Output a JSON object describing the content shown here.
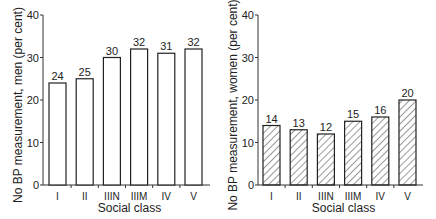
{
  "chart_data": [
    {
      "type": "bar",
      "title": "",
      "xlabel": "Social class",
      "ylabel": "No BP measurement, men (per cent)",
      "categories": [
        "I",
        "II",
        "IIIN",
        "IIIM",
        "IV",
        "V"
      ],
      "values": [
        24,
        25,
        30,
        32,
        31,
        32
      ],
      "data_labels": [
        "24",
        "25",
        "30",
        "32",
        "31",
        "32"
      ],
      "ylim": [
        0,
        40
      ],
      "yticks": [
        "0",
        "10",
        "20",
        "30",
        "40"
      ],
      "grid": false,
      "fill": "white"
    },
    {
      "type": "bar",
      "title": "",
      "xlabel": "Social class",
      "ylabel": "No BP measurement, women (per cent)",
      "categories": [
        "I",
        "II",
        "IIIN",
        "IIIM",
        "IV",
        "V"
      ],
      "values": [
        14,
        13,
        12,
        15,
        16,
        20
      ],
      "data_labels": [
        "14",
        "13",
        "12",
        "15",
        "16",
        "20"
      ],
      "ylim": [
        0,
        40
      ],
      "yticks": [
        "0",
        "10",
        "20",
        "30",
        "40"
      ],
      "grid": false,
      "fill": "hatched"
    }
  ]
}
